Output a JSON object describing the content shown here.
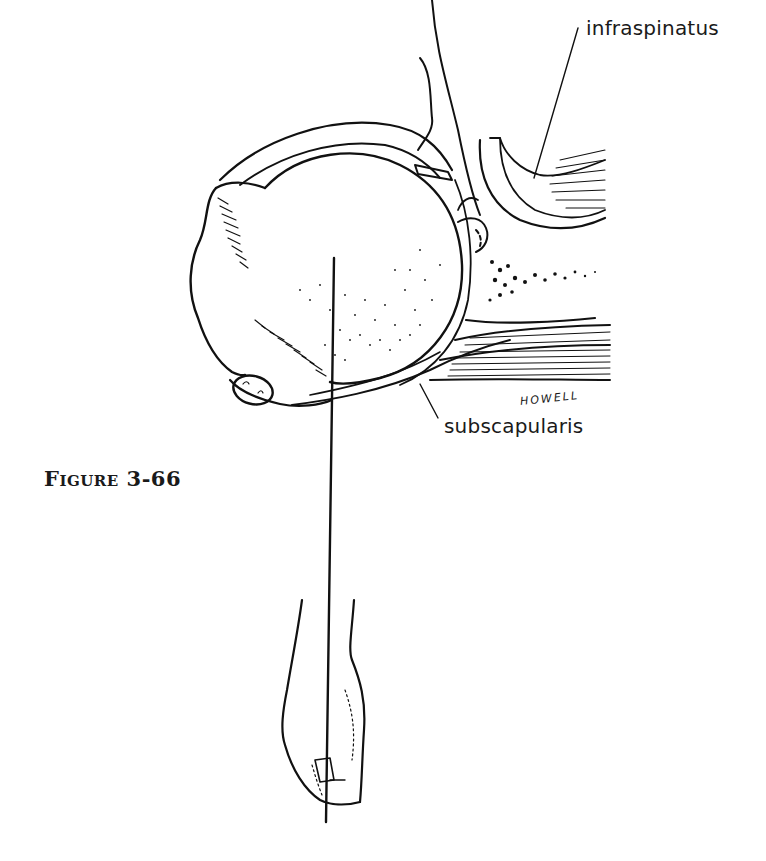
{
  "figure": {
    "caption": "Figure 3-66",
    "artist_signature": "HOWELL",
    "labels": {
      "infraspinatus": "infraspinatus",
      "subscapularis": "subscapularis"
    },
    "colors": {
      "ink": "#111111",
      "background": "#ffffff"
    }
  }
}
